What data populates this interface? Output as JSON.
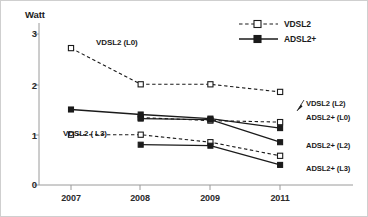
{
  "axis": {
    "ylabel": "Watt",
    "yticks": [
      "0",
      "1",
      "2",
      "3"
    ],
    "xticks": [
      "2007",
      "2008",
      "2009",
      "2011"
    ]
  },
  "legend": {
    "entries": [
      {
        "label": "VDSL2",
        "style": "dashed-open-square"
      },
      {
        "label": "ADSL2+",
        "style": "solid-filled-square"
      }
    ]
  },
  "inline_labels": {
    "vdsl2_l0": "VDSL2  (L0)",
    "vdsl2_l3": "VDSL2 ( L3)",
    "vdsl2_l2": "VDSL2  (L2)",
    "adsl2_l0": "ADSL2+ (L0)",
    "adsl2_l2": "ADSL2+ (L2)",
    "adsl2_l3": "ADSL2+ (L3)"
  },
  "colors": {
    "line": "#1b1b1b",
    "axis": "#9a9a9a",
    "border": "#cfcfcf",
    "text": "#1b1b1b"
  },
  "chart_data": {
    "type": "line",
    "title": "",
    "xlabel": "",
    "ylabel": "Watt",
    "categories": [
      "2007",
      "2008",
      "2009",
      "2011"
    ],
    "ylim": [
      0,
      3
    ],
    "yticks": [
      0,
      1,
      2,
      3
    ],
    "grid": false,
    "legend_position": "top-right",
    "series": [
      {
        "name": "VDSL2 (L0)",
        "technology": "VDSL2",
        "marker": "open-square",
        "linestyle": "dashed",
        "x": [
          "2007",
          "2008",
          "2009",
          "2011"
        ],
        "values": [
          2.72,
          2.0,
          2.0,
          1.85
        ]
      },
      {
        "name": "VDSL2 (L2)",
        "technology": "VDSL2",
        "marker": "open-square",
        "linestyle": "dashed",
        "x": [
          "2008",
          "2009",
          "2011"
        ],
        "values": [
          1.34,
          1.28,
          1.25
        ]
      },
      {
        "name": "VDSL2 (L3)",
        "technology": "VDSL2",
        "marker": "open-square",
        "linestyle": "dashed",
        "x": [
          "2007",
          "2008",
          "2009",
          "2011"
        ],
        "values": [
          1.0,
          1.0,
          0.85,
          0.58
        ]
      },
      {
        "name": "ADSL2+ (L0)",
        "technology": "ADSL2+",
        "marker": "filled-square",
        "linestyle": "solid",
        "x": [
          "2007",
          "2008",
          "2009",
          "2011"
        ],
        "values": [
          1.5,
          1.4,
          1.32,
          1.13
        ]
      },
      {
        "name": "ADSL2+ (L2)",
        "technology": "ADSL2+",
        "marker": "filled-square",
        "linestyle": "solid",
        "x": [
          "2008",
          "2009",
          "2011"
        ],
        "values": [
          1.32,
          1.3,
          0.85
        ]
      },
      {
        "name": "ADSL2+ (L3)",
        "technology": "ADSL2+",
        "marker": "filled-square",
        "linestyle": "solid",
        "x": [
          "2008",
          "2009",
          "2011"
        ],
        "values": [
          0.8,
          0.78,
          0.4
        ]
      }
    ]
  }
}
